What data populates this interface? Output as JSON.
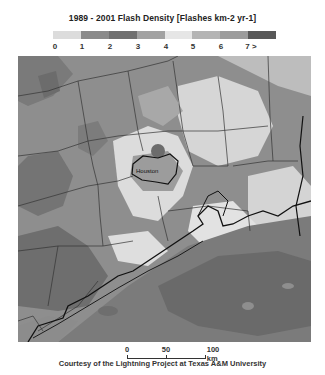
{
  "title": "1989 - 2001 Flash Density [Flashes km-2 yr-1]",
  "legend": {
    "swatches": [
      {
        "range": "0-1",
        "color": "#dcdcdc"
      },
      {
        "range": "1-2",
        "color": "#8a8a8a"
      },
      {
        "range": "2-3",
        "color": "#707070"
      },
      {
        "range": "3-4",
        "color": "#a2a2a2"
      },
      {
        "range": "4-5",
        "color": "#e6e6e6"
      },
      {
        "range": "5-6",
        "color": "#b4b4b4"
      },
      {
        "range": "6-7",
        "color": "#9c9c9c"
      },
      {
        "range": "7+",
        "color": "#585858"
      }
    ],
    "labels": [
      "0",
      "1",
      "2",
      "3",
      "4",
      "5",
      "6",
      "7 >"
    ]
  },
  "map": {
    "region": "Southeast Texas / Gulf Coast",
    "city_label": "Houston"
  },
  "scale_bar": {
    "labels": [
      "0",
      "50",
      "100 km"
    ]
  },
  "credit": "Courtesy of the Lightning Project at Texas A&M University"
}
